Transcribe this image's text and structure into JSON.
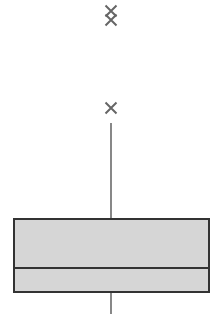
{
  "chart_data": {
    "type": "box",
    "title": "",
    "xlabel": "",
    "ylabel": "",
    "axes_visible": false,
    "grid": false,
    "legend": null,
    "units": "relative (no axis ticks shown; value = 326 - pixel y)",
    "series": [
      {
        "name": "",
        "whisker_low": 12,
        "q1": 34,
        "median": 58,
        "q3": 107,
        "whisker_high": 203,
        "outliers": [
          218,
          306,
          315
        ]
      }
    ],
    "ylim": [
      0,
      326
    ]
  },
  "style": {
    "box_fill": "#d6d6d6",
    "box_stroke": "#333333",
    "whisker_color": "#555555",
    "outlier_color": "#666666",
    "background": "#ffffff"
  },
  "layout": {
    "center_x": 111,
    "box_left": 14,
    "box_right": 209,
    "pixel_height": 326
  }
}
